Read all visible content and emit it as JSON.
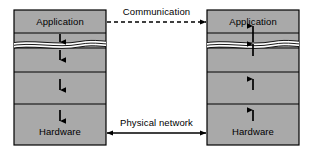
{
  "diagram": {
    "colors": {
      "box_fill": "#a9a9a9",
      "box_stroke": "#000000",
      "divider": "#000000",
      "arrow": "#000000",
      "background": "#ffffff",
      "break_gap": "#ffffff"
    },
    "stacks": [
      {
        "id": "left-stack",
        "name": "left-protocol-stack",
        "top_label": "Application",
        "bottom_label": "Hardware",
        "arrow_direction": "down",
        "layer_count": 5,
        "internal_arrows": 4,
        "has_break": true
      },
      {
        "id": "right-stack",
        "name": "right-protocol-stack",
        "top_label": "Application",
        "bottom_label": "Hardware",
        "arrow_direction": "up",
        "layer_count": 5,
        "internal_arrows": 4,
        "has_break": true
      }
    ],
    "connections": [
      {
        "id": "communication-link",
        "label": "Communication",
        "style": "dashed",
        "arrowheads": "right",
        "position": "top"
      },
      {
        "id": "physical-network-link",
        "label": "Physical network",
        "style": "solid",
        "arrowheads": "both",
        "position": "bottom"
      }
    ]
  }
}
